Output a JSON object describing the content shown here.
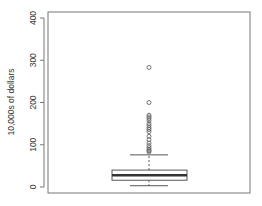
{
  "chart_data": {
    "type": "boxplot",
    "title": "",
    "xlabel": "",
    "ylabel": "10,000s of dollars",
    "ylim": [
      0,
      400
    ],
    "yticks": [
      0,
      100,
      200,
      300,
      400
    ],
    "ytick_labels": [
      "0",
      "100",
      "200",
      "300",
      "400"
    ],
    "grid": false,
    "legend": null,
    "box": {
      "lower_whisker": 3,
      "q1": 16,
      "median": 28,
      "q3": 40,
      "upper_whisker": 76
    },
    "outliers": [
      283,
      200,
      170,
      166,
      162,
      157,
      150,
      145,
      140,
      136,
      131,
      120,
      112,
      104,
      98,
      93,
      89,
      86,
      83
    ]
  },
  "axis": {
    "ylabel": "10,000s of dollars",
    "ticks": [
      "0",
      "100",
      "200",
      "300",
      "400"
    ]
  },
  "colors": {
    "axis": "#555555",
    "box_border": "#555555",
    "median": "#333333",
    "outlier": "#666666"
  }
}
